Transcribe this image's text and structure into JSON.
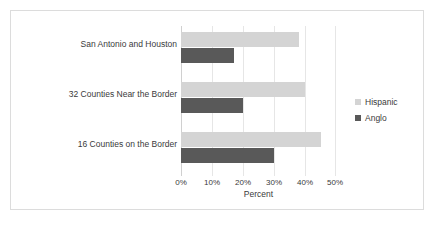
{
  "chart_data": {
    "type": "bar",
    "orientation": "horizontal",
    "title": "",
    "xlabel": "Percent",
    "ylabel": "",
    "xlim": [
      0,
      50
    ],
    "xticks": [
      "0%",
      "10%",
      "20%",
      "30%",
      "40%",
      "50%"
    ],
    "xtick_values": [
      0,
      10,
      20,
      30,
      40,
      50
    ],
    "grid": true,
    "legend_position": "right",
    "categories": [
      "San Antonio and Houston",
      "32 Counties Near the Border",
      "16 Counties on the Border"
    ],
    "series": [
      {
        "name": "Hispanic",
        "color": "#d4d4d4",
        "values": [
          38,
          40,
          45
        ]
      },
      {
        "name": "Anglo",
        "color": "#595959",
        "values": [
          17,
          20,
          30
        ]
      }
    ]
  },
  "legend": {
    "items": [
      {
        "label": "Hispanic",
        "color": "#d4d4d4"
      },
      {
        "label": "Anglo",
        "color": "#595959"
      }
    ]
  },
  "colors": {
    "hispanic": "#d4d4d4",
    "anglo": "#595959",
    "border": "#dcdcdc",
    "gridline": "#e6e6e6",
    "background": "#ffffff"
  }
}
